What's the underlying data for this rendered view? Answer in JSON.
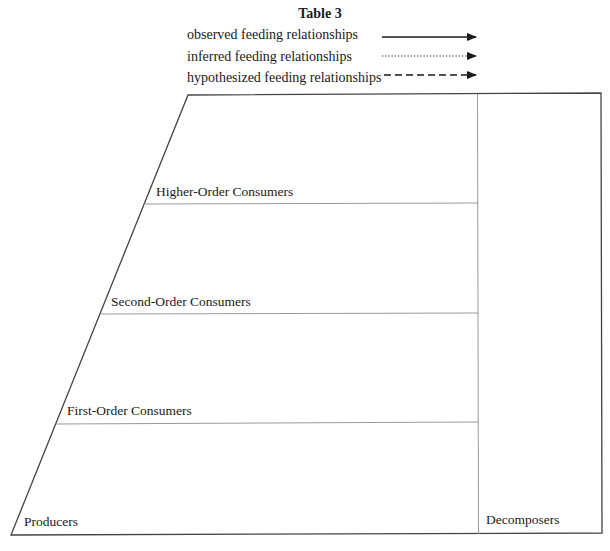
{
  "title": "Table 3",
  "legend": [
    {
      "label": "observed feeding relationships",
      "style": "solid"
    },
    {
      "label": "inferred feeding relationships",
      "style": "dotted"
    },
    {
      "label": "hypothesized feeding relationships",
      "style": "dashed"
    }
  ],
  "levels": [
    {
      "label": "Higher-Order Consumers"
    },
    {
      "label": "Second-Order Consumers"
    },
    {
      "label": "First-Order Consumers"
    },
    {
      "label": "Producers"
    }
  ],
  "side_column": {
    "label": "Decomposers"
  },
  "colors": {
    "outline": "#444444",
    "divider": "#999999",
    "text": "#1a1a1a"
  }
}
